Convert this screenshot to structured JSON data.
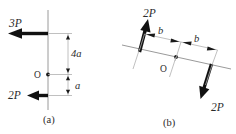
{
  "figure": {
    "panels": [
      {
        "id": "a",
        "caption": "(a)",
        "origin_label": "O",
        "forces": [
          {
            "label": "3P",
            "direction": "left",
            "offset_from_O": "4a"
          },
          {
            "label": "2P",
            "direction": "left",
            "offset_from_O": "a"
          }
        ],
        "dimensions": [
          {
            "label": "4a"
          },
          {
            "label": "a"
          }
        ]
      },
      {
        "id": "b",
        "caption": "(b)",
        "origin_label": "O",
        "forces": [
          {
            "label": "2P",
            "direction": "up-right",
            "offset_from_O": "b"
          },
          {
            "label": "2P",
            "direction": "down-left",
            "offset_from_O": "b"
          }
        ],
        "dimensions": [
          {
            "label": "b"
          },
          {
            "label": "b"
          }
        ]
      }
    ],
    "colors": {
      "ink": "#111111",
      "axis": "#9a9a9a",
      "dimension": "#b0b0b0",
      "background": "#ffffff"
    }
  }
}
